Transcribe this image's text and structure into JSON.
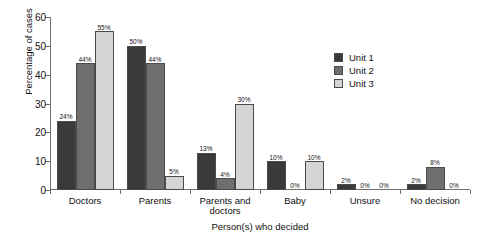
{
  "chart_data": {
    "type": "bar",
    "title": "",
    "subtitle": "",
    "xlabel": "Person(s) who decided",
    "ylabel": "Percentage of cases",
    "ylim": [
      0,
      60
    ],
    "yticks": [
      0,
      10,
      20,
      30,
      40,
      50,
      60
    ],
    "ytick_labels": [
      "0",
      "10",
      "20",
      "30",
      "40",
      "50",
      "60"
    ],
    "grid": false,
    "legend_position": "inside-right",
    "value_label_suffix": "%",
    "categories": [
      "Doctors",
      "Parents",
      "Parents and doctors",
      "Baby",
      "Unsure",
      "No decision"
    ],
    "series": [
      {
        "name": "Unit 1",
        "color": "#3a3a3a",
        "values": [
          24,
          50,
          13,
          10,
          2,
          2
        ],
        "labels": [
          "24%",
          "50%",
          "13%",
          "10%",
          "2%",
          "2%"
        ]
      },
      {
        "name": "Unit 2",
        "color": "#6e6e6e",
        "values": [
          44,
          44,
          4,
          0,
          0,
          8
        ],
        "labels": [
          "44%",
          "44%",
          "4%",
          "0%",
          "0%",
          "8%"
        ]
      },
      {
        "name": "Unit 3",
        "color": "#d5d5d5",
        "values": [
          55,
          5,
          30,
          10,
          0,
          0
        ],
        "labels": [
          "55%",
          "5%",
          "30%",
          "10%",
          "0%",
          "0%"
        ]
      }
    ],
    "axis_color": "#6f6f6f",
    "bar_outline_color": "#4a4a4a",
    "background_color": "#ffffff"
  }
}
